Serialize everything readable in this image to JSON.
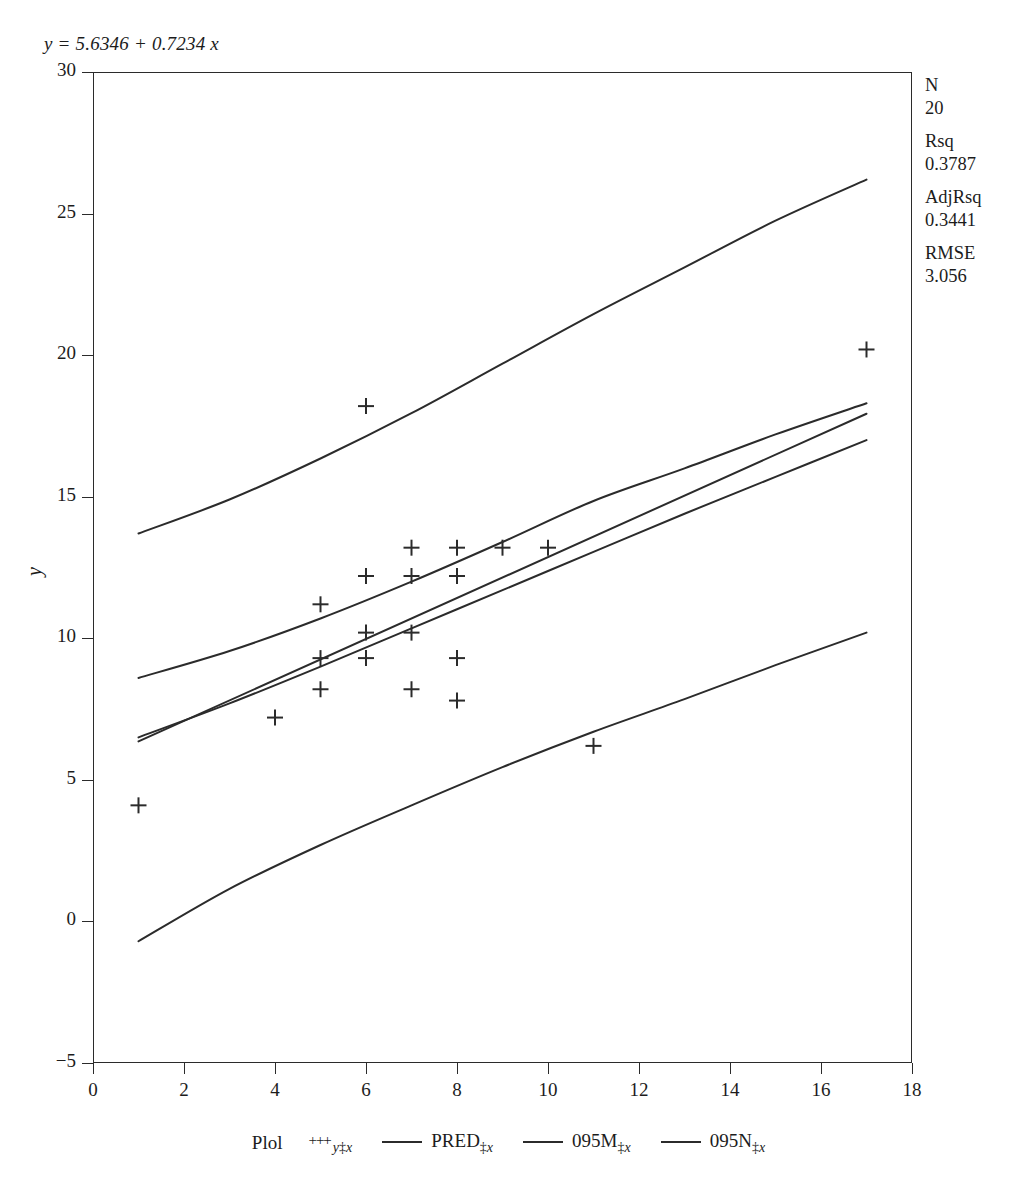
{
  "equation": "y = 5.6346 + 0.7234 x",
  "stats": [
    {
      "label": "N",
      "value": "20"
    },
    {
      "label": "Rsq",
      "value": "0.3787"
    },
    {
      "label": "AdjRsq",
      "value": "0.3441"
    },
    {
      "label": "RMSE",
      "value": "3.056"
    }
  ],
  "legend": {
    "title": "Plol",
    "items": [
      {
        "symbol": "plus",
        "name": "y",
        "sep": "‡",
        "arg": "x"
      },
      {
        "symbol": "line",
        "name": "PRED",
        "sep": "‡",
        "arg": "x"
      },
      {
        "symbol": "line",
        "name": "095M",
        "sep": "‡",
        "arg": "x"
      },
      {
        "symbol": "line",
        "name": "095N",
        "sep": "‡",
        "arg": "x"
      }
    ]
  },
  "chart_data": {
    "type": "scatter",
    "title": "",
    "subtitle": "y = 5.6346 + 0.7234 x",
    "xlabel": "",
    "ylabel": "y",
    "xlim": [
      0,
      18
    ],
    "ylim": [
      -5,
      30
    ],
    "xticks": [
      0,
      2,
      4,
      6,
      8,
      10,
      12,
      14,
      16,
      18
    ],
    "yticks": [
      -5,
      0,
      5,
      10,
      15,
      20,
      25,
      30
    ],
    "grid": false,
    "legend_position": "bottom",
    "marker": "+",
    "regression": {
      "intercept": 5.6346,
      "slope": 0.7234,
      "n": 20,
      "rsq": 0.3787,
      "adj_rsq": 0.3441,
      "rmse": 3.056
    },
    "points": [
      {
        "x": 1,
        "y": 4.1
      },
      {
        "x": 4,
        "y": 7.2
      },
      {
        "x": 5,
        "y": 11.2
      },
      {
        "x": 5,
        "y": 9.3
      },
      {
        "x": 5,
        "y": 8.2
      },
      {
        "x": 6,
        "y": 18.2
      },
      {
        "x": 6,
        "y": 12.2
      },
      {
        "x": 6,
        "y": 10.2
      },
      {
        "x": 6,
        "y": 9.3
      },
      {
        "x": 7,
        "y": 13.2
      },
      {
        "x": 7,
        "y": 12.2
      },
      {
        "x": 7,
        "y": 10.2
      },
      {
        "x": 7,
        "y": 8.2
      },
      {
        "x": 8,
        "y": 13.2
      },
      {
        "x": 8,
        "y": 12.2
      },
      {
        "x": 8,
        "y": 9.3
      },
      {
        "x": 8,
        "y": 7.8
      },
      {
        "x": 9,
        "y": 13.2
      },
      {
        "x": 10,
        "y": 13.2
      },
      {
        "x": 11,
        "y": 6.2
      },
      {
        "x": 17,
        "y": 20.2
      }
    ],
    "series": [
      {
        "name": "PRED",
        "type": "line",
        "x": [
          1,
          17
        ],
        "y": [
          6.36,
          17.93
        ]
      },
      {
        "name": "095M-upper",
        "type": "line",
        "x": [
          1,
          3,
          5,
          7,
          9,
          11,
          13,
          15,
          17
        ],
        "y": [
          8.6,
          9.55,
          10.7,
          12.0,
          13.4,
          14.85,
          16.0,
          17.2,
          18.3
        ]
      },
      {
        "name": "095M-lower",
        "type": "line",
        "x": [
          1,
          3,
          5,
          7,
          9,
          11,
          13,
          15,
          17
        ],
        "y": [
          6.5,
          7.7,
          9.0,
          10.35,
          11.7,
          13.05,
          14.4,
          15.7,
          17.0
        ]
      },
      {
        "name": "095N-upper",
        "type": "line",
        "x": [
          1,
          3,
          5,
          7,
          9,
          11,
          13,
          15,
          17
        ],
        "y": [
          13.7,
          14.9,
          16.35,
          17.95,
          19.7,
          21.45,
          23.1,
          24.75,
          26.2
        ]
      },
      {
        "name": "095N-lower",
        "type": "line",
        "x": [
          1,
          3,
          5,
          7,
          9,
          11,
          13,
          15,
          17
        ],
        "y": [
          -0.7,
          1.15,
          2.7,
          4.1,
          5.45,
          6.7,
          7.85,
          9.05,
          10.2
        ]
      }
    ]
  }
}
